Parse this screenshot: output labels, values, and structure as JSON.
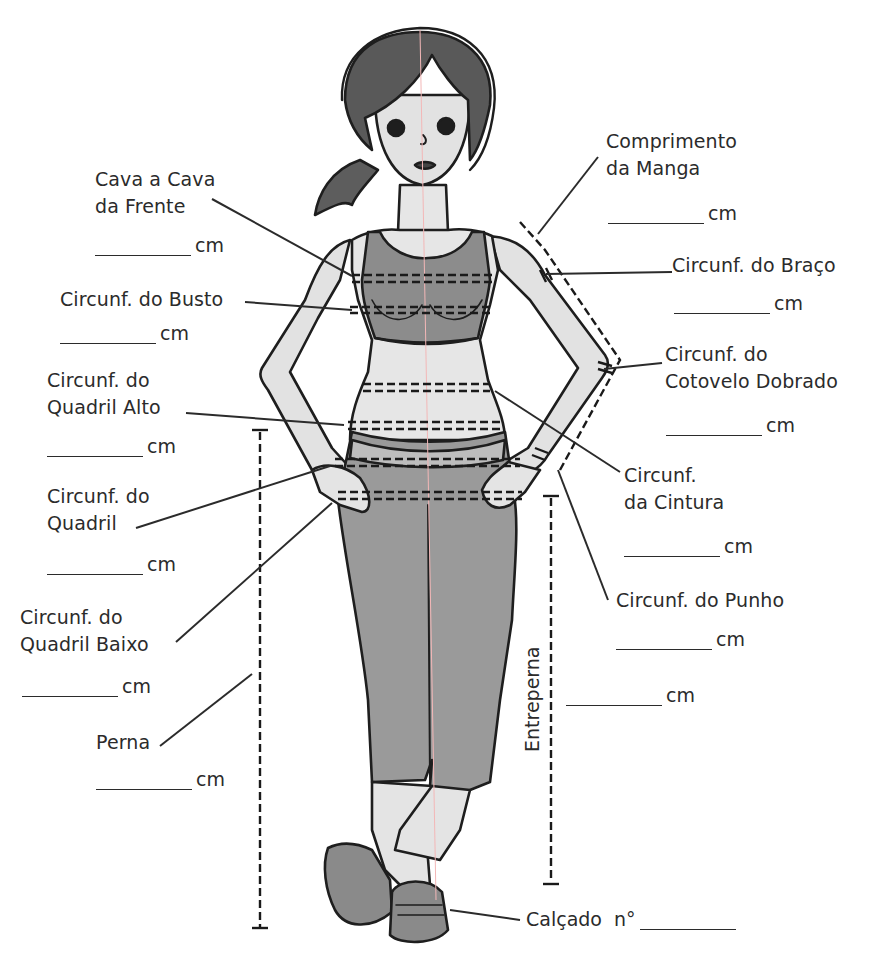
{
  "unit": "cm",
  "measurements": {
    "cava_a_cava": {
      "line1": "Cava a Cava",
      "line2": "da Frente",
      "unit": "cm",
      "value": ""
    },
    "busto": {
      "line1": "Circunf. do Busto",
      "unit": "cm",
      "value": ""
    },
    "quadril_alto": {
      "line1": "Circunf. do",
      "line2": "Quadril Alto",
      "unit": "cm",
      "value": ""
    },
    "quadril": {
      "line1": "Circunf. do",
      "line2": "Quadril",
      "unit": "cm",
      "value": ""
    },
    "quadril_baixo": {
      "line1": "Circunf. do",
      "line2": "Quadril Baixo",
      "unit": "cm",
      "value": ""
    },
    "perna": {
      "line1": "Perna",
      "unit": "cm",
      "value": ""
    },
    "comprimento_manga": {
      "line1": "Comprimento",
      "line2": "da Manga",
      "unit": "cm",
      "value": ""
    },
    "braco": {
      "line1": "Circunf. do Braço",
      "unit": "cm",
      "value": ""
    },
    "cotovelo": {
      "line1": "Circunf. do",
      "line2": "Cotovelo Dobrado",
      "unit": "cm",
      "value": ""
    },
    "cintura": {
      "line1": "Circunf.",
      "line2": "da Cintura",
      "unit": "cm",
      "value": ""
    },
    "punho": {
      "line1": "Circunf. do Punho",
      "unit": "cm",
      "value": ""
    },
    "entreperna": {
      "line1": "Entreperna",
      "unit": "cm",
      "value": ""
    },
    "calcado": {
      "line1": "Calçado  n°",
      "value": ""
    }
  },
  "colors": {
    "ink": "#2b2b2b",
    "hair": "#5a5a5a",
    "skin": "#e4e4e4",
    "clothing": "#8f8f8f",
    "clothing_dark": "#6e6e6e",
    "background": "#ffffff"
  }
}
